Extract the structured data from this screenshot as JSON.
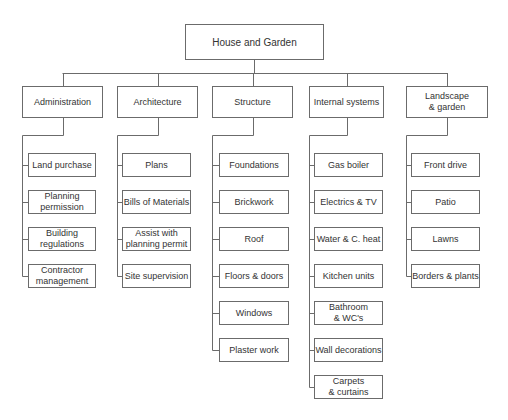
{
  "root": {
    "label": "House and Garden"
  },
  "branches": [
    {
      "label": "Administration",
      "children": [
        "Land purchase",
        "Planning\npermission",
        "Building\nregulations",
        "Contractor\nmanagement"
      ]
    },
    {
      "label": "Architecture",
      "children": [
        "Plans",
        "Bills of Materials",
        "Assist with\nplanning permit",
        "Site supervision"
      ]
    },
    {
      "label": "Structure",
      "children": [
        "Foundations",
        "Brickwork",
        "Roof",
        "Floors & doors",
        "Windows",
        "Plaster work"
      ]
    },
    {
      "label": "Internal systems",
      "children": [
        "Gas boiler",
        "Electrics & TV",
        "Water & C. heat",
        "Kitchen units",
        "Bathroom\n& WC's",
        "Wall decorations",
        "Carpets\n& curtains"
      ]
    },
    {
      "label": "Landscape\n& garden",
      "children": [
        "Front drive",
        "Patio",
        "Lawns",
        "Borders & plants"
      ]
    }
  ]
}
